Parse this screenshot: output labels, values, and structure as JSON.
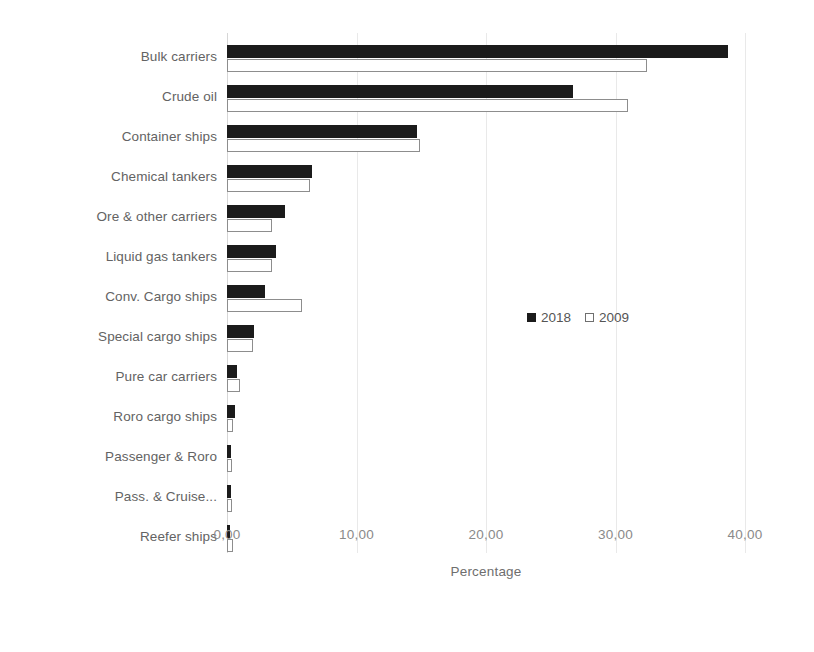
{
  "chart_data": {
    "type": "bar",
    "orientation": "horizontal",
    "title": "",
    "xlabel": "Percentage",
    "ylabel": "",
    "xlim": [
      0,
      40
    ],
    "grid": true,
    "legend_position": "center-right",
    "xticks": [
      "0,00",
      "10,00",
      "20,00",
      "30,00",
      "40,00"
    ],
    "xtick_values": [
      0,
      10,
      20,
      30,
      40
    ],
    "categories": [
      "Bulk carriers",
      "Crude oil",
      "Container ships",
      "Chemical tankers",
      "Ore & other carriers",
      "Liquid gas tankers",
      "Conv. Cargo ships",
      "Special cargo ships",
      "Pure car carriers",
      "Roro cargo ships",
      "Passenger & Roro",
      "Pass. & Cruise...",
      "Reefer ships"
    ],
    "series": [
      {
        "name": "2018",
        "color": "#1b1b1b",
        "values": [
          38.7,
          26.7,
          14.7,
          6.6,
          4.5,
          3.8,
          2.9,
          2.1,
          0.8,
          0.6,
          0.3,
          0.3,
          0.2
        ]
      },
      {
        "name": "2009",
        "color": "#ffffff",
        "values": [
          32.4,
          31.0,
          14.9,
          6.4,
          3.5,
          3.5,
          5.8,
          2.0,
          1.0,
          0.5,
          0.4,
          0.4,
          0.5
        ]
      }
    ]
  },
  "legend": {
    "entries": [
      {
        "label": "2018",
        "swatch": "filled"
      },
      {
        "label": "2009",
        "swatch": "hollow"
      }
    ]
  }
}
